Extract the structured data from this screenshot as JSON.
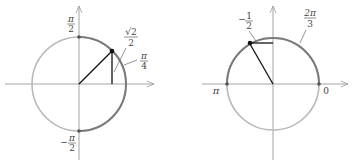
{
  "diagrams": [
    {
      "name": "unit-circle-pi-over-4",
      "center": [
        79,
        84
      ],
      "radius": 47,
      "highlighted_arc": {
        "from_angle": "-pi/2",
        "to_angle": "pi/2",
        "side": "right"
      },
      "point_angle": "pi/4",
      "labels": {
        "top": {
          "num": "π",
          "den": "2"
        },
        "bottom": {
          "sign": "−",
          "num": "π",
          "den": "2"
        },
        "sqrt_value": {
          "num": "√2",
          "den": "2"
        },
        "angle": {
          "num": "π",
          "den": "4"
        }
      }
    },
    {
      "name": "unit-circle-2pi-over-3",
      "center": [
        273,
        84
      ],
      "radius": 46,
      "highlighted_arc": {
        "from_angle": "0",
        "to_angle": "pi",
        "side": "upper"
      },
      "point_angle": "2pi/3",
      "labels": {
        "left": "π",
        "right": "0",
        "cos_value": {
          "sign": "−",
          "num": "1",
          "den": "2"
        },
        "angle": {
          "num": "2π",
          "den": "3"
        }
      }
    }
  ],
  "colors": {
    "axis": "#9a9a9a",
    "circle_light": "#b8b8b8",
    "circle_dark": "#7a7a7a",
    "segment": "#111111",
    "text": "#444444"
  }
}
